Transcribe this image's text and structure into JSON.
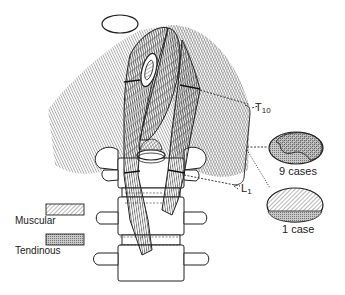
{
  "figure": {
    "levels": [
      {
        "id": "t10",
        "label": "T",
        "subscript": "10"
      },
      {
        "id": "l1",
        "label": "L",
        "subscript": "1"
      }
    ],
    "cross_sections": [
      {
        "id": "variant-9",
        "label": "9 cases"
      },
      {
        "id": "variant-1",
        "label": "1 case"
      }
    ],
    "legend": [
      {
        "id": "muscular",
        "label": "Muscular",
        "pattern": "diagonal-hatch"
      },
      {
        "id": "tendinous",
        "label": "Tendinous",
        "pattern": "stipple"
      }
    ]
  },
  "colors": {
    "ink": "#222222",
    "background": "#ffffff",
    "tendinous_fill": "#b8b8b8"
  }
}
